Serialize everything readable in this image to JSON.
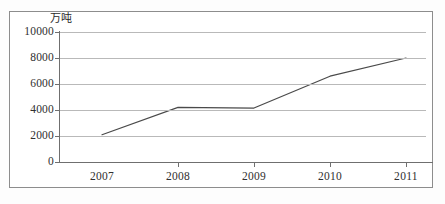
{
  "chart_data": {
    "type": "line",
    "title": "",
    "subtitle": "",
    "xlabel": "",
    "ylabel": "",
    "unit_label": "万吨",
    "categories": [
      "2007",
      "2008",
      "2009",
      "2010",
      "2011"
    ],
    "x": [
      2007,
      2008,
      2009,
      2010,
      2011
    ],
    "series": [
      {
        "name": "",
        "values": [
          2100,
          4200,
          4150,
          6600,
          8000
        ]
      }
    ],
    "ylim": [
      0,
      10000
    ],
    "yticks": [
      0,
      2000,
      4000,
      6000,
      8000,
      10000
    ],
    "ytick_labels": [
      "0",
      "2000",
      "4000",
      "6000",
      "8000",
      "10000"
    ],
    "xtick_labels": [
      "2007",
      "2008",
      "2009",
      "2010",
      "2011"
    ],
    "grid": true,
    "grid_axis": "y",
    "legend": false,
    "legend_position": "none",
    "line_color": "#4a4a4a",
    "grid_color": "#b9b9b9",
    "axis_color": "#6f6f6f",
    "border_color": "#8d8d8d",
    "background_color": "#ffffff"
  }
}
